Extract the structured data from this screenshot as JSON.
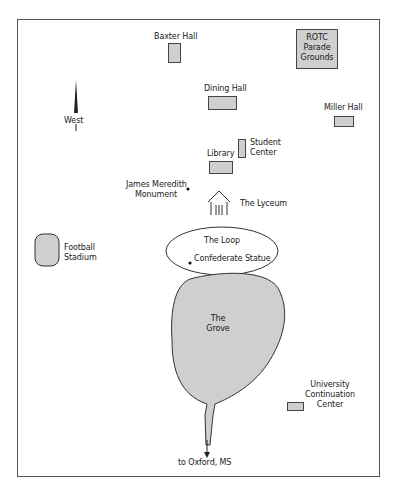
{
  "map": {
    "compass": {
      "direction_label": "West",
      "icon": "north-arrow-icon"
    },
    "buildings": [
      {
        "id": "baxter-hall",
        "label": "Baxter Hall"
      },
      {
        "id": "rotc",
        "label": "ROTC Parade Grounds",
        "lines": [
          "ROTC",
          "Parade",
          "Grounds"
        ]
      },
      {
        "id": "dining-hall",
        "label": "Dining Hall"
      },
      {
        "id": "miller-hall",
        "label": "Miller Hall"
      },
      {
        "id": "library",
        "label": "Library"
      },
      {
        "id": "student-center",
        "label": "Student Center",
        "lines": [
          "Student",
          "Center"
        ]
      },
      {
        "id": "football-stadium",
        "label": "Football Stadium",
        "lines": [
          "Football",
          "Stadium"
        ]
      },
      {
        "id": "ucc",
        "label": "University Continuation Center",
        "lines": [
          "University",
          "Continuation",
          "Center"
        ]
      }
    ],
    "landmarks": {
      "meredith": {
        "lines": [
          "James Meredith",
          "Monument"
        ]
      },
      "lyceum": {
        "label": "The Lyceum"
      },
      "loop": {
        "label": "The Loop"
      },
      "statue": {
        "label": "Confederate Statue"
      },
      "grove": {
        "lines": [
          "The",
          "Grove"
        ]
      }
    },
    "exit": {
      "label": "to Oxford, MS"
    },
    "colors": {
      "fill": "#cfcfcf",
      "stroke": "#444444",
      "frame": "#555555"
    }
  }
}
